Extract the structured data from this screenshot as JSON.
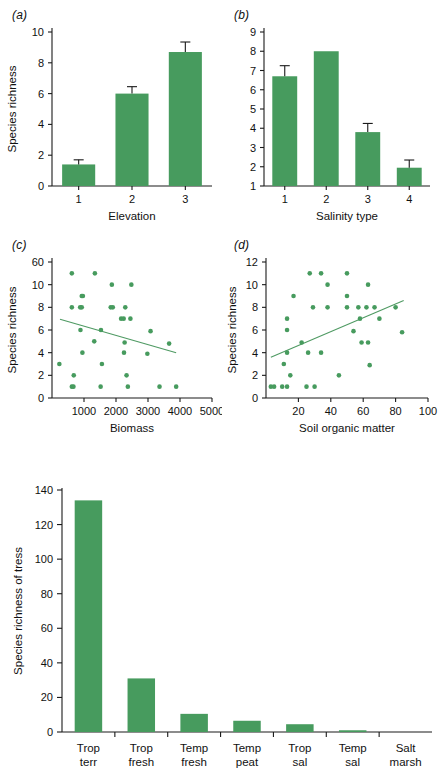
{
  "figure": {
    "background": "#ffffff",
    "series_color": "#479b5e",
    "axis_color": "#1a1a1a",
    "trend_color": "#5a9e6b"
  },
  "panels": {
    "a": {
      "label": "(a)"
    },
    "b": {
      "label": "(b)"
    },
    "c": {
      "label": "(c)"
    },
    "d": {
      "label": "(d)"
    },
    "e": {
      "label": ""
    }
  },
  "chart_data": [
    {
      "id": "panel-a",
      "panel": "(a)",
      "type": "bar",
      "title": "",
      "xlabel": "Elevation",
      "ylabel": "Species richness",
      "categories": [
        "1",
        "2",
        "3"
      ],
      "values": [
        1.4,
        6.0,
        8.7
      ],
      "errors": [
        0.3,
        0.45,
        0.65
      ],
      "ylim": [
        0,
        10
      ],
      "yticks": [
        0,
        2,
        4,
        6,
        8,
        10
      ],
      "ytick_labels": [
        "0",
        "2",
        "4",
        "6",
        "8",
        "10"
      ],
      "grid": false,
      "legend": "none"
    },
    {
      "id": "panel-b",
      "panel": "(b)",
      "type": "bar",
      "title": "",
      "xlabel": "Salinity type",
      "ylabel": "",
      "categories": [
        "1",
        "2",
        "3",
        "4"
      ],
      "values": [
        6.7,
        8.0,
        3.8,
        1.95
      ],
      "errors": [
        0.55,
        0.0,
        0.45,
        0.4
      ],
      "ylim": [
        1,
        9
      ],
      "yticks": [
        1,
        2,
        3,
        4,
        5,
        6,
        7,
        8,
        9
      ],
      "ytick_labels": [
        "1",
        "2",
        "3",
        "4",
        "5",
        "6",
        "7",
        "8",
        "9"
      ],
      "grid": false,
      "legend": "none"
    },
    {
      "id": "panel-c",
      "panel": "(c)",
      "type": "scatter",
      "title": "",
      "xlabel": "Biomass",
      "ylabel": "Species richness",
      "xlim": [
        0,
        5000
      ],
      "ylim": [
        0,
        12
      ],
      "xticks": [
        1000,
        2000,
        3000,
        4000,
        5000
      ],
      "xtick_labels": [
        "1000",
        "2000",
        "3000",
        "4000",
        "5000"
      ],
      "yticks": [
        0,
        2,
        4,
        6,
        8,
        10,
        12
      ],
      "ytick_labels": [
        "0",
        "2",
        "4",
        "6",
        "8",
        "10",
        "60"
      ],
      "grid": false,
      "legend": "none",
      "points": [
        [
          620,
          11
        ],
        [
          1340,
          11
        ],
        [
          1870,
          10
        ],
        [
          2480,
          10
        ],
        [
          930,
          9
        ],
        [
          965,
          9
        ],
        [
          620,
          8
        ],
        [
          880,
          8
        ],
        [
          930,
          8
        ],
        [
          1835,
          8
        ],
        [
          1900,
          8
        ],
        [
          2290,
          8
        ],
        [
          2160,
          7
        ],
        [
          2240,
          7
        ],
        [
          2450,
          7
        ],
        [
          890,
          6
        ],
        [
          1530,
          6
        ],
        [
          3080,
          5.9
        ],
        [
          1320,
          5
        ],
        [
          2270,
          4.9
        ],
        [
          3660,
          4.8
        ],
        [
          950,
          4
        ],
        [
          2250,
          4
        ],
        [
          2980,
          3.9
        ],
        [
          230,
          3
        ],
        [
          1560,
          3
        ],
        [
          680,
          2
        ],
        [
          2330,
          2
        ],
        [
          620,
          1
        ],
        [
          670,
          1
        ],
        [
          1520,
          1
        ],
        [
          2370,
          1
        ],
        [
          3360,
          1
        ],
        [
          3880,
          1
        ]
      ],
      "trend_line": {
        "x": [
          250,
          3880
        ],
        "y": [
          6.95,
          4.0
        ],
        "direction": "negative"
      }
    },
    {
      "id": "panel-d",
      "panel": "(d)",
      "type": "scatter",
      "title": "",
      "xlabel": "Soil organic matter",
      "ylabel": "Species richness",
      "xlim": [
        0,
        100
      ],
      "ylim": [
        0,
        12
      ],
      "xticks": [
        20,
        40,
        60,
        80,
        100
      ],
      "xtick_labels": [
        "20",
        "40",
        "60",
        "80",
        "100"
      ],
      "yticks": [
        0,
        2,
        4,
        6,
        8,
        10,
        12
      ],
      "ytick_labels": [
        "0",
        "2",
        "4",
        "6",
        "8",
        "10",
        "12"
      ],
      "grid": false,
      "legend": "none",
      "points": [
        [
          27,
          11
        ],
        [
          34,
          11
        ],
        [
          50,
          11
        ],
        [
          38,
          10
        ],
        [
          63,
          10
        ],
        [
          17,
          9
        ],
        [
          50,
          9
        ],
        [
          29,
          8
        ],
        [
          38,
          8
        ],
        [
          50,
          8
        ],
        [
          57,
          8
        ],
        [
          62,
          8
        ],
        [
          67,
          8
        ],
        [
          80,
          8
        ],
        [
          13,
          7
        ],
        [
          58,
          7
        ],
        [
          70,
          7
        ],
        [
          13,
          6
        ],
        [
          54,
          5.9
        ],
        [
          84,
          5.8
        ],
        [
          22,
          4.9
        ],
        [
          59,
          4.9
        ],
        [
          63,
          4.9
        ],
        [
          13,
          4
        ],
        [
          26,
          4
        ],
        [
          34,
          4
        ],
        [
          11,
          3
        ],
        [
          64,
          2.9
        ],
        [
          15,
          2
        ],
        [
          45,
          2
        ],
        [
          3,
          1
        ],
        [
          5,
          1
        ],
        [
          10,
          1
        ],
        [
          13,
          1
        ],
        [
          25,
          1
        ],
        [
          30,
          1
        ]
      ],
      "trend_line": {
        "x": [
          3,
          85
        ],
        "y": [
          3.6,
          8.6
        ],
        "direction": "positive"
      }
    },
    {
      "id": "panel-e",
      "panel": "",
      "type": "bar",
      "title": "",
      "xlabel": "",
      "ylabel": "Species richness of tress",
      "categories": [
        "Trop\nterr",
        "Trop\nfresh",
        "Temp\nfresh",
        "Temp\npeat",
        "Trop\nsal",
        "Temp\nsal",
        "Salt\nmarsh"
      ],
      "category_lines": [
        [
          "Trop",
          "terr"
        ],
        [
          "Trop",
          "fresh"
        ],
        [
          "Temp",
          "fresh"
        ],
        [
          "Temp",
          "peat"
        ],
        [
          "Trop",
          "sal"
        ],
        [
          "Temp",
          "sal"
        ],
        [
          "Salt",
          "marsh"
        ]
      ],
      "values": [
        134,
        31,
        10.5,
        6.5,
        4.5,
        1,
        0
      ],
      "ylim": [
        0,
        140
      ],
      "yticks": [
        0,
        20,
        40,
        60,
        80,
        100,
        120,
        140
      ],
      "ytick_labels": [
        "0",
        "20",
        "40",
        "60",
        "80",
        "100",
        "120",
        "140"
      ],
      "grid": false,
      "legend": "none"
    }
  ]
}
